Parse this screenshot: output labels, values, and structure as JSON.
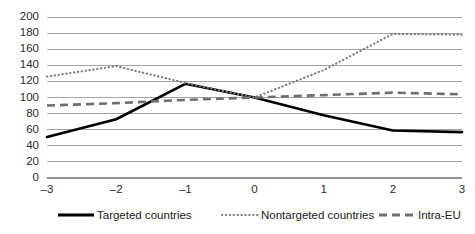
{
  "chart_data": {
    "type": "line",
    "title": "",
    "subtitle": "",
    "xlabel": "",
    "ylabel": "",
    "x": [
      -3,
      -2,
      -1,
      0,
      1,
      2,
      3
    ],
    "xtick_labels": [
      "–3",
      "–2",
      "–1",
      "0",
      "1",
      "2",
      "3"
    ],
    "ytick_labels": [
      "0",
      "20",
      "40",
      "60",
      "80",
      "100",
      "120",
      "140",
      "160",
      "180",
      "200"
    ],
    "yticks": [
      0,
      20,
      40,
      60,
      80,
      100,
      120,
      140,
      160,
      180,
      200
    ],
    "ylim": [
      0,
      200
    ],
    "xlim": [
      -3,
      3
    ],
    "grid": "horizontal",
    "legend_position": "bottom",
    "series": [
      {
        "name": "Targeted countries",
        "style": "solid",
        "color": "#000000",
        "values": [
          51,
          73,
          117,
          100,
          78,
          59,
          57
        ]
      },
      {
        "name": "Nontargeted countries",
        "style": "dotted",
        "color": "#7d7d7d",
        "values": [
          126,
          139,
          118,
          100,
          134,
          179,
          178
        ]
      },
      {
        "name": "Intra-EU",
        "style": "dashed",
        "color": "#6e6e6e",
        "values": [
          90,
          93,
          97,
          100,
          103,
          106,
          104
        ]
      }
    ]
  },
  "legend": {
    "items": [
      {
        "label": "Targeted countries"
      },
      {
        "label": "Nontargeted countries"
      },
      {
        "label": "Intra-EU"
      }
    ]
  },
  "axes": {
    "y": {
      "labels": [
        "200",
        "180",
        "160",
        "140",
        "120",
        "100",
        "80",
        "60",
        "40",
        "20",
        "0"
      ]
    },
    "x": {
      "labels": [
        "–3",
        "–2",
        "–1",
        "0",
        "1",
        "2",
        "3"
      ]
    }
  }
}
